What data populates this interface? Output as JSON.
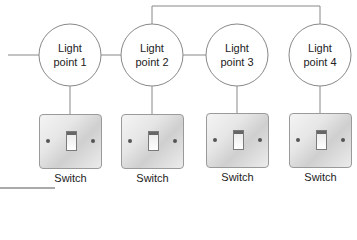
{
  "diagram": {
    "type": "lighting circuit wiring",
    "light_points": [
      {
        "label_line1": "Light",
        "label_line2": "point 1"
      },
      {
        "label_line1": "Light",
        "label_line2": "point 2"
      },
      {
        "label_line1": "Light",
        "label_line2": "point 3"
      },
      {
        "label_line1": "Light",
        "label_line2": "point 4"
      }
    ],
    "switches": [
      {
        "label": "Switch"
      },
      {
        "label": "Switch"
      },
      {
        "label": "Switch"
      },
      {
        "label": "Switch"
      }
    ],
    "colors": {
      "line": "#888888",
      "text": "#222222"
    }
  }
}
